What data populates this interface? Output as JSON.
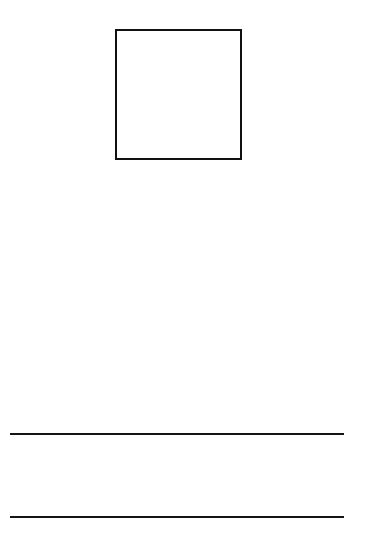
{
  "page": {
    "background_color": "#ffffff",
    "stroke_color": "#111111"
  },
  "elements": {
    "image_box": {
      "shape": "square-outline",
      "content": ""
    },
    "lines": [
      {
        "shape": "horizontal-line",
        "content": ""
      },
      {
        "shape": "horizontal-line",
        "content": ""
      }
    ]
  }
}
